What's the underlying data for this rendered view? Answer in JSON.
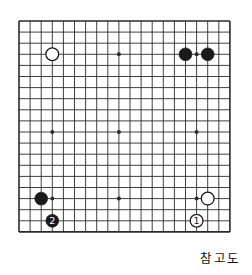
{
  "figure": {
    "caption": "참고도",
    "board": {
      "cols": 20,
      "rows": 20,
      "origin_x": 19,
      "origin_y": 21,
      "spacing": 11.1,
      "line_color": "#2b2b2b",
      "board_color": "#ffffff",
      "border_width": 1.6,
      "line_width": 0.9,
      "star_radius": 2.0,
      "stone_radius": 6.4
    },
    "star_points": [
      {
        "col": 3,
        "row": 3
      },
      {
        "col": 3,
        "row": 10
      },
      {
        "col": 3,
        "row": 16
      },
      {
        "col": 9,
        "row": 3
      },
      {
        "col": 9,
        "row": 10
      },
      {
        "col": 9,
        "row": 16
      },
      {
        "col": 16,
        "row": 3
      },
      {
        "col": 16,
        "row": 10
      },
      {
        "col": 16,
        "row": 16
      }
    ],
    "stones": [
      {
        "id": "white-upper-left",
        "color": "white",
        "col": 3,
        "row": 3,
        "label": ""
      },
      {
        "id": "black-upper-right-a",
        "color": "black",
        "col": 15,
        "row": 3,
        "label": ""
      },
      {
        "id": "black-upper-right-b",
        "color": "black",
        "col": 17,
        "row": 3,
        "label": ""
      },
      {
        "id": "black-lower-left",
        "color": "black",
        "col": 2,
        "row": 16,
        "label": ""
      },
      {
        "id": "black-move-2",
        "color": "black",
        "col": 3,
        "row": 18,
        "label": "2"
      },
      {
        "id": "white-lower-right",
        "color": "white",
        "col": 17,
        "row": 16,
        "label": ""
      },
      {
        "id": "white-move-1",
        "color": "white",
        "col": 16,
        "row": 18,
        "label": "1"
      }
    ],
    "colors": {
      "black_stone": "#1a1a1a",
      "white_stone": "#ffffff",
      "stone_outline": "#1a1a1a",
      "black_label": "#ffffff",
      "white_label": "#1a1a1a",
      "grid": "#2b2b2b",
      "caption_text": "#111111"
    }
  }
}
